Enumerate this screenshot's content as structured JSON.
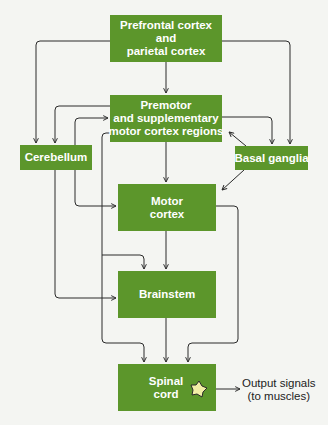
{
  "diagram": {
    "colors": {
      "box": "#5c962b",
      "box_text": "#ffffff",
      "line": "#2a2a2a",
      "neuron": "#f1eea6",
      "background": "#f4f5f2"
    },
    "nodes": {
      "prefrontal": {
        "lines": [
          "Prefrontal cortex",
          "and",
          "parietal cortex"
        ]
      },
      "premotor": {
        "lines": [
          "Premotor",
          "and supplementary",
          "motor cortex regions"
        ]
      },
      "cerebellum": {
        "lines": [
          "Cerebellum"
        ]
      },
      "basal_ganglia": {
        "lines": [
          "Basal ganglia"
        ]
      },
      "motor_cortex": {
        "lines": [
          "Motor",
          "cortex"
        ]
      },
      "brainstem": {
        "lines": [
          "Brainstem"
        ]
      },
      "spinal_cord": {
        "lines": [
          "Spinal",
          "cord"
        ]
      }
    },
    "output": {
      "lines": [
        "Output signals",
        "(to muscles)"
      ]
    },
    "edges": [
      [
        "Prefrontal cortex and parietal cortex",
        "Premotor and supplementary motor cortex regions"
      ],
      [
        "Prefrontal cortex and parietal cortex",
        "Cerebellum"
      ],
      [
        "Prefrontal cortex and parietal cortex",
        "Basal ganglia"
      ],
      [
        "Premotor and supplementary motor cortex regions",
        "Cerebellum"
      ],
      [
        "Cerebellum",
        "Premotor and supplementary motor cortex regions"
      ],
      [
        "Premotor and supplementary motor cortex regions",
        "Basal ganglia"
      ],
      [
        "Basal ganglia",
        "Premotor and supplementary motor cortex regions"
      ],
      [
        "Basal ganglia",
        "Motor cortex"
      ],
      [
        "Premotor and supplementary motor cortex regions",
        "Motor cortex"
      ],
      [
        "Premotor and supplementary motor cortex regions",
        "Brainstem"
      ],
      [
        "Premotor and supplementary motor cortex regions",
        "Spinal cord"
      ],
      [
        "Cerebellum",
        "Motor cortex"
      ],
      [
        "Cerebellum",
        "Brainstem"
      ],
      [
        "Motor cortex",
        "Brainstem"
      ],
      [
        "Motor cortex",
        "Spinal cord"
      ],
      [
        "Brainstem",
        "Spinal cord"
      ],
      [
        "Spinal cord",
        "Output signals (to muscles)"
      ]
    ]
  }
}
